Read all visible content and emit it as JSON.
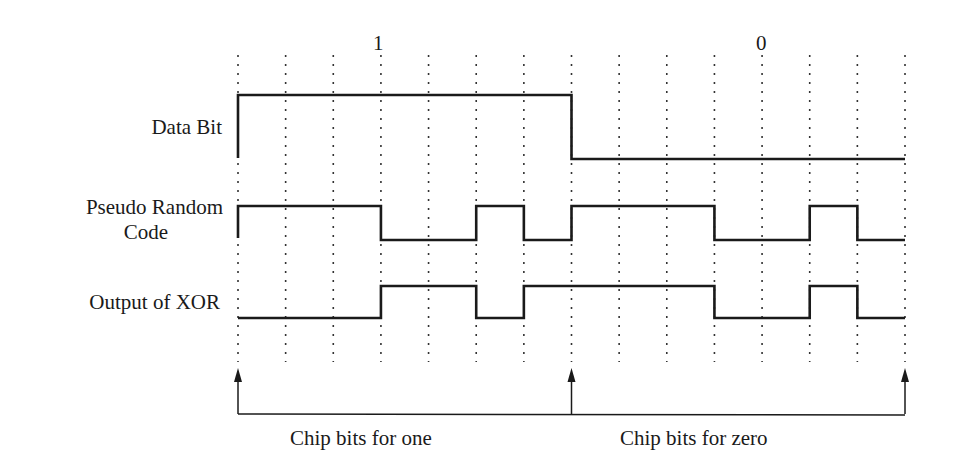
{
  "bit_labels": [
    "1",
    "0"
  ],
  "rows": [
    {
      "label": "Data Bit"
    },
    {
      "label_line1": "Pseudo Random",
      "label_line2": "Code"
    },
    {
      "label": "Output of XOR"
    }
  ],
  "bottom_labels": [
    "Chip bits for one",
    "Chip bits for zero"
  ],
  "signals": {
    "data_bit": [
      1,
      0
    ],
    "chips_per_bit": 7,
    "pseudo_random_code": [
      1,
      1,
      1,
      0,
      0,
      1,
      0,
      1,
      1,
      1,
      0,
      0,
      1,
      0
    ],
    "xor_output": [
      0,
      0,
      0,
      1,
      1,
      0,
      1,
      1,
      1,
      1,
      0,
      0,
      1,
      0
    ]
  },
  "grid": {
    "x0": 238,
    "x_end": 905,
    "divisions": 14
  },
  "colors": {
    "line": "#1a1a1a",
    "grid": "#333333",
    "background": "#ffffff"
  }
}
